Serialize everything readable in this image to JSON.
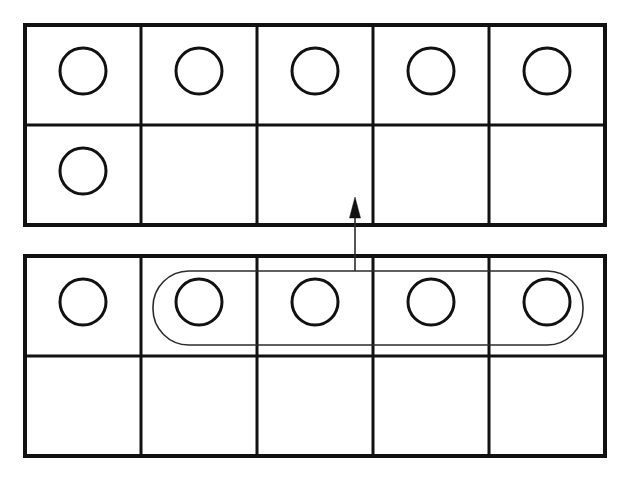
{
  "canvas": {
    "width": 624,
    "height": 482,
    "background_color": "#ffffff"
  },
  "style": {
    "frame_stroke_color": "#111111",
    "frame_outer_stroke_width": 4,
    "frame_inner_stroke_width": 3,
    "counter_stroke_color": "#111111",
    "counter_stroke_width": 3,
    "lasso_stroke_color": "#2b2b2b",
    "lasso_stroke_width": 1.6,
    "arrow_stroke_color": "#2b2b2b",
    "arrow_stroke_width": 1.6,
    "arrow_head_fill": "#111111"
  },
  "diagram": {
    "type": "ten-frame-regrouping",
    "counter_shape": "circle",
    "counter_radius": 23,
    "grids": [
      {
        "id": "top-frame",
        "role": "result-frame",
        "x": 25,
        "y": 25,
        "width": 580,
        "height": 200,
        "columns": 5,
        "rows": 2,
        "cell_width": 116,
        "cell_height": 100,
        "counter_count": 6,
        "cells": [
          {
            "row": 0,
            "col": 0,
            "filled": true
          },
          {
            "row": 0,
            "col": 1,
            "filled": true
          },
          {
            "row": 0,
            "col": 2,
            "filled": true
          },
          {
            "row": 0,
            "col": 3,
            "filled": true
          },
          {
            "row": 0,
            "col": 4,
            "filled": true
          },
          {
            "row": 1,
            "col": 0,
            "filled": true
          },
          {
            "row": 1,
            "col": 1,
            "filled": false
          },
          {
            "row": 1,
            "col": 2,
            "filled": false
          },
          {
            "row": 1,
            "col": 3,
            "filled": false
          },
          {
            "row": 1,
            "col": 4,
            "filled": false
          }
        ]
      },
      {
        "id": "bottom-frame",
        "role": "source-frame",
        "x": 25,
        "y": 256,
        "width": 580,
        "height": 200,
        "columns": 5,
        "rows": 2,
        "cell_width": 116,
        "cell_height": 100,
        "counter_count": 5,
        "cells": [
          {
            "row": 0,
            "col": 0,
            "filled": true
          },
          {
            "row": 0,
            "col": 1,
            "filled": true
          },
          {
            "row": 0,
            "col": 2,
            "filled": true
          },
          {
            "row": 0,
            "col": 3,
            "filled": true
          },
          {
            "row": 0,
            "col": 4,
            "filled": true
          },
          {
            "row": 1,
            "col": 0,
            "filled": false
          },
          {
            "row": 1,
            "col": 1,
            "filled": false
          },
          {
            "row": 1,
            "col": 2,
            "filled": false
          },
          {
            "row": 1,
            "col": 3,
            "filled": false
          },
          {
            "row": 1,
            "col": 4,
            "filled": false
          }
        ]
      }
    ],
    "selection_lasso": {
      "id": "counter-selection-lasso",
      "encloses_grid": "bottom-frame",
      "encloses_row": 0,
      "encloses_columns": [
        1,
        2,
        3,
        4
      ],
      "enclosed_counter_count": 4,
      "x": 153,
      "y": 271,
      "width": 430,
      "height": 74,
      "corner_radius": 36
    },
    "move_arrow": {
      "id": "move-counters-arrow",
      "direction": "up",
      "from_x": 355,
      "from_y": 271,
      "to_x": 355,
      "to_y": 197,
      "head_width": 11,
      "head_length": 21,
      "meaning": "move selected counters to upper frame"
    }
  }
}
